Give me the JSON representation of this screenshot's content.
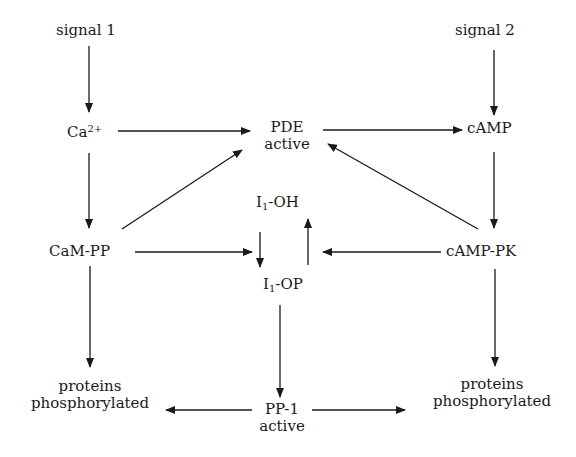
{
  "diagram": {
    "nodes": {
      "signal1": {
        "label": "signal 1"
      },
      "signal2": {
        "label": "signal 2"
      },
      "ca": {
        "base": "Ca",
        "sup": "2+"
      },
      "pde": {
        "line1": "PDE",
        "line2": "active"
      },
      "camp": {
        "label": "cAMP"
      },
      "cam_pp": {
        "label": "CaM-PP"
      },
      "i1oh": {
        "base": "I",
        "sub": "1",
        "rest": "-OH"
      },
      "i1op": {
        "base": "I",
        "sub": "1",
        "rest": "-OP"
      },
      "camp_pk": {
        "label": "cAMP-PK"
      },
      "proteins_left": {
        "line1": "proteins",
        "line2": "phosphorylated"
      },
      "pp1": {
        "line1": "PP-1",
        "line2": "active"
      },
      "proteins_right": {
        "line1": "proteins",
        "line2": "phosphorylated"
      }
    },
    "edges": [
      {
        "from": "signal 1",
        "to": "Ca2+"
      },
      {
        "from": "signal 2",
        "to": "cAMP"
      },
      {
        "from": "Ca2+",
        "to": "PDE active"
      },
      {
        "from": "Ca2+",
        "to": "CaM-PP"
      },
      {
        "from": "PDE active",
        "to": "cAMP"
      },
      {
        "from": "cAMP",
        "to": "cAMP-PK"
      },
      {
        "from": "CaM-PP",
        "to": "PDE active"
      },
      {
        "from": "cAMP-PK",
        "to": "PDE active"
      },
      {
        "from": "CaM-PP",
        "to": "I1-OP"
      },
      {
        "from": "cAMP-PK",
        "to": "I1-OH"
      },
      {
        "from": "I1-OH",
        "to": "I1-OP"
      },
      {
        "from": "I1-OP",
        "to": "I1-OH"
      },
      {
        "from": "CaM-PP",
        "to": "proteins phosphorylated (left)"
      },
      {
        "from": "cAMP-PK",
        "to": "proteins phosphorylated (right)"
      },
      {
        "from": "I1-OP",
        "to": "PP-1 active"
      },
      {
        "from": "PP-1 active",
        "to": "proteins phosphorylated (left)"
      },
      {
        "from": "PP-1 active",
        "to": "proteins phosphorylated (right)"
      }
    ],
    "colors": {
      "line": "#1a1a1a",
      "text": "#1a1a1a",
      "background": "#ffffff"
    }
  }
}
